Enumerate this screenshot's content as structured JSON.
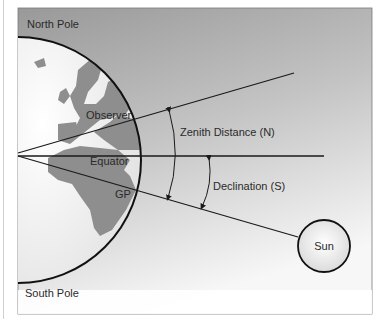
{
  "diagram": {
    "labels": {
      "north_pole": "North Pole",
      "south_pole": "South Pole",
      "observer": "Observer",
      "equator": "Equator",
      "gp": "GP",
      "zenith_distance": "Zenith Distance (N)",
      "declination": "Declination (S)",
      "sun": "Sun"
    },
    "colors": {
      "background_top": "#9a9a9a",
      "background_bottom": "#f4f4f4",
      "earth_ocean": "#f2f2f2",
      "land": "#8e8e8e",
      "lines": "#1a1a1a",
      "sun_fill": "#f6f6f6"
    }
  }
}
